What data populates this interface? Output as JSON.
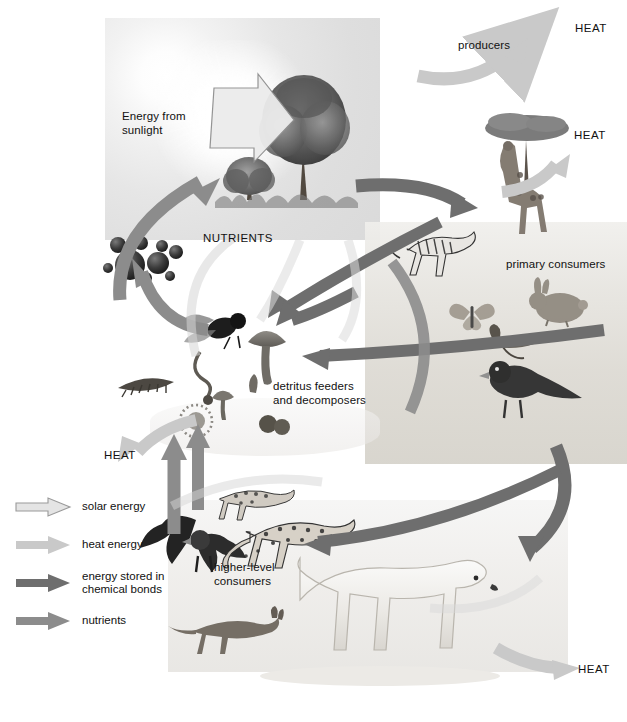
{
  "diagram": {
    "width": 627,
    "height": 722
  },
  "labels": {
    "energy_from_sunlight": "Energy from\nsunlight",
    "producers": "producers",
    "heat_top_right": "HEAT",
    "heat_giraffe": "HEAT",
    "heat_left": "HEAT",
    "heat_bottom_right": "HEAT",
    "nutrients": "NUTRIENTS",
    "primary_consumers": "primary consumers",
    "detritus": "detritus feeders\nand decomposers",
    "higher_level_consumers": "higher-level\nconsumers"
  },
  "legend": {
    "items": [
      {
        "label": "solar energy",
        "color": "#e4e4e4",
        "stroke": "#9a9a9a",
        "icon": "arrow-right-icon"
      },
      {
        "label": "heat energy",
        "color": "#c9c9c9",
        "stroke": "none",
        "icon": "arrow-right-icon"
      },
      {
        "label": "energy stored in\nchemical bonds",
        "color": "#6e6e6e",
        "stroke": "none",
        "icon": "arrow-right-icon"
      },
      {
        "label": "nutrients",
        "color": "#8c8c8c",
        "stroke": "none",
        "icon": "arrow-right-icon"
      }
    ]
  },
  "colors": {
    "solar_energy": "#e4e4e4",
    "solar_stroke": "#9a9a9a",
    "heat_energy": "#c9c9c9",
    "chemical_energy": "#6e6e6e",
    "nutrients": "#8c8c8c",
    "text": "#111111",
    "page_background": "#ffffff"
  },
  "organisms": {
    "producers": [
      "tree-large",
      "tree-small",
      "grass",
      "acacia-tree"
    ],
    "primary_consumers": [
      "giraffe",
      "zebra",
      "rabbit",
      "butterfly",
      "grasshopper",
      "songbird"
    ],
    "detritus_feeders": [
      "fly",
      "mushroom-large",
      "mushroom-small",
      "centipede",
      "worm",
      "bacteria-cluster",
      "puffball"
    ],
    "higher_level_consumers": [
      "hawk",
      "cheetah",
      "serval",
      "fox",
      "polar-bear"
    ],
    "nutrients_pool": [
      "mineral-spheres"
    ]
  }
}
